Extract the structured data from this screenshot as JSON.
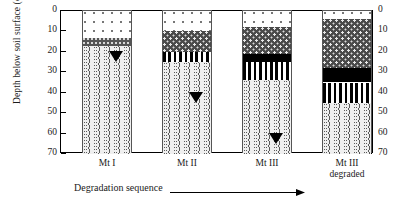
{
  "chart_data": {
    "type": "bar",
    "title": "",
    "subtitle": "",
    "xlabel": "Degradation sequence",
    "ylabel": "Depth below soil surface (cm)",
    "ylim": [
      0,
      70
    ],
    "y_inverted": true,
    "y_ticks": [
      0,
      10,
      20,
      30,
      40,
      50,
      60,
      70
    ],
    "y_tick_labels": [
      "0",
      "10",
      "20",
      "30",
      "40",
      "50",
      "60",
      "70"
    ],
    "dual_axis": true,
    "grid": false,
    "legend": "none",
    "categories": [
      "Mt I",
      "Mt II",
      "Mt III",
      "Mt III degraded"
    ],
    "category_label_lines": [
      [
        "Mt I"
      ],
      [
        "Mt II"
      ],
      [
        "Mt III"
      ],
      [
        "Mt III",
        "degraded"
      ]
    ],
    "stacking": "depth-profile",
    "units": "cm",
    "horizon_patterns": [
      "dots",
      "dark-speckle",
      "thin-band",
      "solid-black",
      "vertical-stripes",
      "wavy"
    ],
    "profiles": [
      {
        "name": "Mt I",
        "water_table_depth": 25,
        "has_water_table": true,
        "horizons": [
          {
            "pattern": "dots",
            "top": 0,
            "bottom": 13
          },
          {
            "pattern": "thin-band",
            "top": 13,
            "bottom": 17
          },
          {
            "pattern": "wavy",
            "top": 17,
            "bottom": 70
          }
        ]
      },
      {
        "name": "Mt II",
        "water_table_depth": 45,
        "has_water_table": true,
        "horizons": [
          {
            "pattern": "dots",
            "top": 0,
            "bottom": 10
          },
          {
            "pattern": "dark-speckle",
            "top": 10,
            "bottom": 20
          },
          {
            "pattern": "vertical-stripes",
            "top": 20,
            "bottom": 25
          },
          {
            "pattern": "wavy",
            "top": 25,
            "bottom": 70
          }
        ]
      },
      {
        "name": "Mt III",
        "water_table_depth": 65,
        "has_water_table": true,
        "horizons": [
          {
            "pattern": "dots",
            "top": 0,
            "bottom": 8
          },
          {
            "pattern": "dark-speckle",
            "top": 8,
            "bottom": 21
          },
          {
            "pattern": "solid-black",
            "top": 21,
            "bottom": 25
          },
          {
            "pattern": "vertical-stripes",
            "top": 25,
            "bottom": 34
          },
          {
            "pattern": "wavy",
            "top": 34,
            "bottom": 70
          }
        ]
      },
      {
        "name": "Mt III degraded",
        "water_table_depth": null,
        "has_water_table": false,
        "horizons": [
          {
            "pattern": "dots",
            "top": 0,
            "bottom": 4
          },
          {
            "pattern": "dark-speckle",
            "top": 4,
            "bottom": 28
          },
          {
            "pattern": "solid-black",
            "top": 28,
            "bottom": 35
          },
          {
            "pattern": "vertical-stripes",
            "top": 35,
            "bottom": 45
          },
          {
            "pattern": "wavy",
            "top": 45,
            "bottom": 70
          }
        ]
      }
    ]
  },
  "axes": {
    "y_title": "Depth below soil surface (cm)",
    "left_tick_labels": [
      "0",
      "10",
      "20",
      "30",
      "40",
      "50",
      "60",
      "70"
    ],
    "right_tick_labels": [
      "0",
      "10",
      "20",
      "30",
      "40",
      "50",
      "60",
      "70"
    ]
  },
  "categories": [
    {
      "line1": "Mt I",
      "line2": ""
    },
    {
      "line1": "Mt II",
      "line2": ""
    },
    {
      "line1": "Mt III",
      "line2": ""
    },
    {
      "line1": "Mt III",
      "line2": "degraded"
    }
  ],
  "footer": {
    "sequence_label": "Degradation sequence"
  }
}
